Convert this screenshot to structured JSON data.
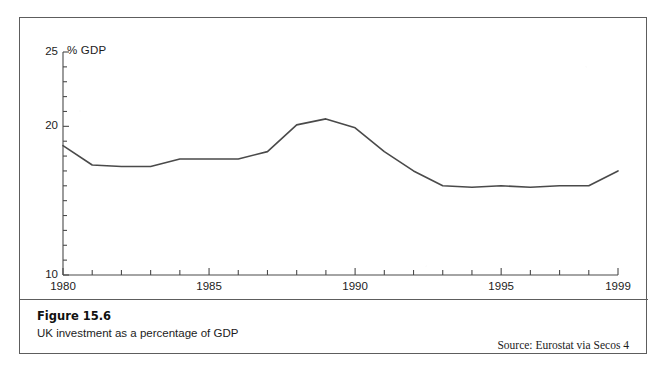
{
  "figure": {
    "caption_title": "Figure 15.6",
    "caption_subtitle": "UK investment as a percentage of GDP",
    "source": "Source: Eurostat via Secos 4"
  },
  "chart_data": {
    "type": "line",
    "title": "",
    "subtitle": "",
    "xlabel": "",
    "ylabel": "% GDP",
    "ylim": [
      10,
      25
    ],
    "xlim": [
      1980,
      1999
    ],
    "grid": false,
    "legend": "none",
    "y_major_ticks": [
      10,
      20,
      25
    ],
    "y_minor_ticks": [
      11,
      12,
      13,
      14,
      15,
      16,
      17,
      18,
      19,
      21,
      22,
      23,
      24
    ],
    "y_tick_labels": [
      "10",
      "20",
      "25"
    ],
    "x_major_ticks": [
      1980,
      1985,
      1990,
      1995,
      1999
    ],
    "x_tick_labels": [
      "1980",
      "1985",
      "1990",
      "1995",
      "1999"
    ],
    "x_minor_ticks": [
      1981,
      1982,
      1983,
      1984,
      1986,
      1987,
      1988,
      1989,
      1991,
      1992,
      1993,
      1994,
      1996,
      1997,
      1998
    ],
    "line_color": "#4a4a4a",
    "x": [
      1980,
      1981,
      1982,
      1983,
      1984,
      1985,
      1986,
      1987,
      1988,
      1989,
      1990,
      1991,
      1992,
      1993,
      1994,
      1995,
      1996,
      1997,
      1998,
      1999
    ],
    "series": [
      {
        "name": "UK investment (% of GDP)",
        "values": [
          18.7,
          17.4,
          17.3,
          17.3,
          17.8,
          17.8,
          17.8,
          18.3,
          20.1,
          20.5,
          19.9,
          18.3,
          17.0,
          16.0,
          15.9,
          16.0,
          15.9,
          16.0,
          16.0,
          17.0
        ]
      }
    ]
  },
  "colors": {
    "frame": "#5d5d5d",
    "axis": "#4a4a4a",
    "text": "#1c1c1c",
    "background": "#ffffff"
  }
}
